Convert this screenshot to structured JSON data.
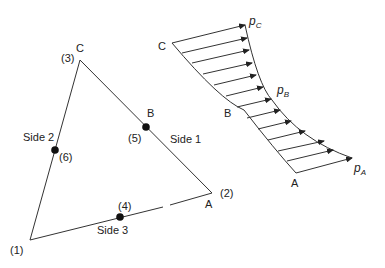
{
  "triangle": {
    "vertices": [
      {
        "node": "(1)",
        "point": ""
      },
      {
        "node": "(2)",
        "point": "A"
      },
      {
        "node": "(3)",
        "point": "C"
      }
    ],
    "midnodes": [
      {
        "node": "(4)",
        "side": "Side 3"
      },
      {
        "node": "(5)",
        "point": "B",
        "side": "Side 1"
      },
      {
        "node": "(6)",
        "side": "Side 2"
      }
    ],
    "labels": {
      "n1": "(1)",
      "n2": "(2)",
      "n3": "(3)",
      "n4": "(4)",
      "n5": "(5)",
      "n6": "(6)",
      "A": "A",
      "B": "B",
      "C": "C",
      "side1": "Side 1",
      "side2": "Side 2",
      "side3": "Side 3"
    }
  },
  "pressure": {
    "labels": {
      "C": "C",
      "B": "B",
      "A": "A",
      "pC_main": "p",
      "pC_sub": "C",
      "pB_main": "p",
      "pB_sub": "B",
      "pA_main": "p",
      "pA_sub": "A"
    },
    "arrow_count": 12
  },
  "colors": {
    "line": "#333333",
    "text": "#222222",
    "background": "#ffffff"
  }
}
